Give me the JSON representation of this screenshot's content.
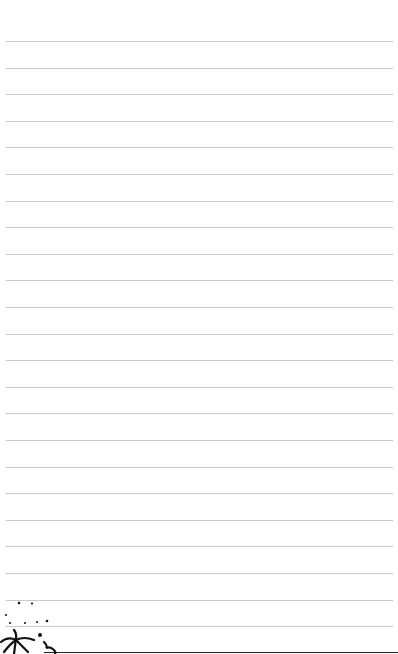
{
  "page": {
    "type": "lined-notebook-paper",
    "background_color": "#ffffff",
    "rule_color": "#c8c8c8",
    "rule_count": 23,
    "first_rule_y": 41,
    "rule_spacing": 26.6,
    "rule_left": 6,
    "rule_right": 393
  },
  "decoration": {
    "icon": "palm-tree-dots-doodle-icon",
    "color": "#111111"
  }
}
